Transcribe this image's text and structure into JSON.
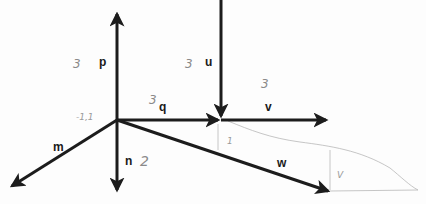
{
  "diagram": {
    "type": "vector-diagram",
    "origin": {
      "x": 117,
      "y": 120
    },
    "stroke_color": "#1c1c1c",
    "pencil_color": "#9a9a9a",
    "vectors": [
      {
        "name": "p",
        "label": "p",
        "annotation": "3",
        "from": [
          117,
          120
        ],
        "to": [
          117,
          12
        ]
      },
      {
        "name": "n",
        "label": "n",
        "annotation": "2",
        "from": [
          117,
          120
        ],
        "to": [
          117,
          192
        ]
      },
      {
        "name": "m",
        "label": "m",
        "annotation": "",
        "from": [
          117,
          120
        ],
        "to": [
          10,
          188
        ]
      },
      {
        "name": "q",
        "label": "q",
        "annotation": "3",
        "from": [
          117,
          120
        ],
        "to": [
          220,
          120
        ]
      },
      {
        "name": "u",
        "label": "u",
        "annotation": "3",
        "from": [
          221,
          0
        ],
        "to": [
          221,
          118
        ]
      },
      {
        "name": "v",
        "label": "v",
        "annotation": "3",
        "from": [
          221,
          120
        ],
        "to": [
          328,
          120
        ]
      },
      {
        "name": "w",
        "label": "w",
        "annotation": "",
        "from": [
          117,
          120
        ],
        "to": [
          330,
          192
        ]
      }
    ],
    "origin_annotation": "-1,1",
    "pencil_marks": {
      "small_1": "1",
      "small_2": "V"
    }
  }
}
